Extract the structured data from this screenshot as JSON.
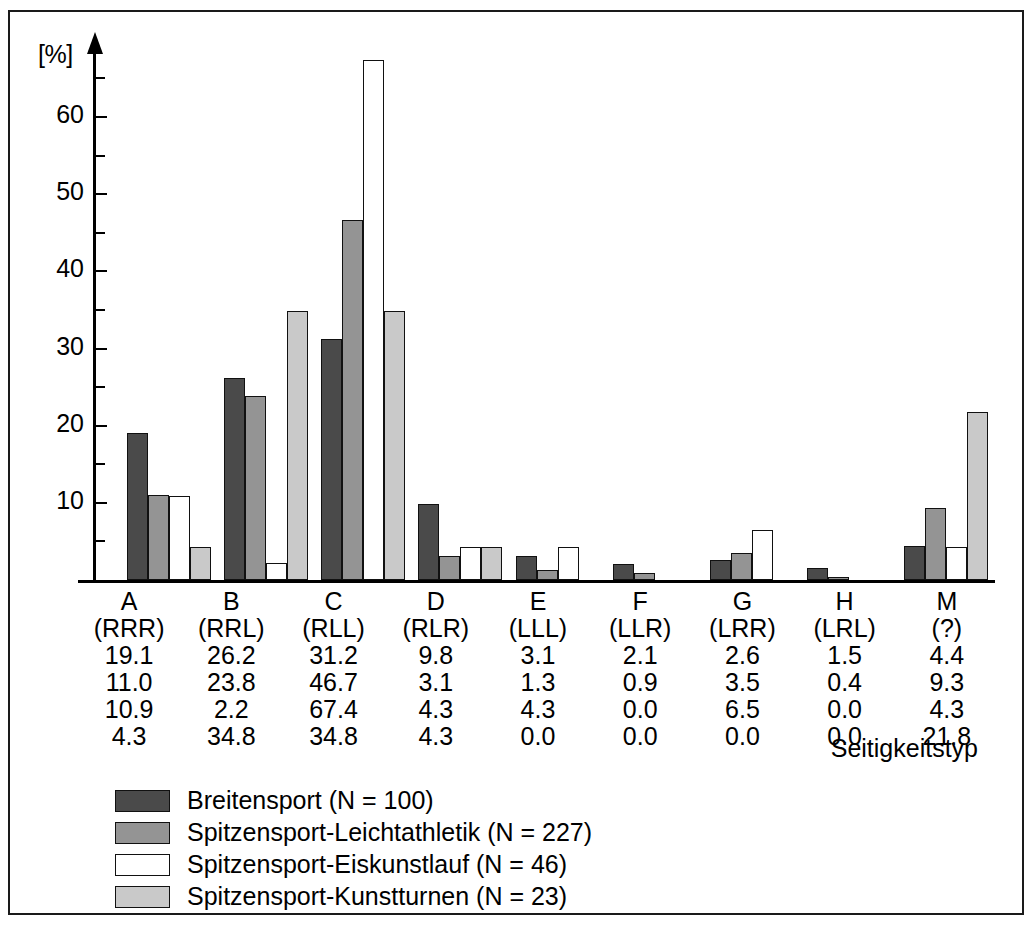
{
  "chart_data": {
    "type": "bar",
    "title": "",
    "xlabel": "Seitigkeitstyp",
    "ylabel": "[%]",
    "ylim": [
      0,
      68
    ],
    "grid": false,
    "legend_position": "bottom-left",
    "y_major_ticks": [
      10,
      20,
      30,
      40,
      50,
      60
    ],
    "y_minor_ticks": [
      5,
      15,
      25,
      35,
      45,
      55,
      65
    ],
    "categories": [
      "A",
      "B",
      "C",
      "D",
      "E",
      "F",
      "G",
      "H",
      "M"
    ],
    "category_codes": [
      "(RRR)",
      "(RRL)",
      "(RLL)",
      "(RLR)",
      "(LLL)",
      "(LLR)",
      "(LRR)",
      "(LRL)",
      "(?)"
    ],
    "series": [
      {
        "name": "Breitensport (N = 100)",
        "color": "#4a4a4a",
        "values": [
          19.1,
          26.2,
          31.2,
          9.8,
          3.1,
          2.1,
          2.6,
          1.5,
          4.4
        ]
      },
      {
        "name": "Spitzensport-Leichtathletik (N = 227)",
        "color": "#949494",
        "values": [
          11.0,
          23.8,
          46.7,
          3.1,
          1.3,
          0.9,
          3.5,
          0.4,
          9.3
        ]
      },
      {
        "name": "Spitzensport-Eiskunstlauf (N = 46)",
        "color": "#ffffff",
        "values": [
          10.9,
          2.2,
          67.4,
          4.3,
          4.3,
          0.0,
          6.5,
          0.0,
          4.3
        ]
      },
      {
        "name": "Spitzensport-Kunstturnen (N = 23)",
        "color": "#c9c9c9",
        "values": [
          4.3,
          34.8,
          34.8,
          4.3,
          0.0,
          0.0,
          0.0,
          0.0,
          21.8
        ]
      }
    ]
  },
  "axis": {
    "unit_label": "[%]",
    "x_title": "Seitigkeitstyp"
  },
  "table": {
    "header_row": [
      "A",
      "B",
      "C",
      "D",
      "E",
      "F",
      "G",
      "H",
      "M"
    ],
    "code_row": [
      "(RRR)",
      "(RRL)",
      "(RLL)",
      "(RLR)",
      "(LLL)",
      "(LLR)",
      "(LRR)",
      "(LRL)",
      "(?)"
    ],
    "rows": [
      [
        "19.1",
        "26.2",
        "31.2",
        "9.8",
        "3.1",
        "2.1",
        "2.6",
        "1.5",
        "4.4"
      ],
      [
        "11.0",
        "23.8",
        "46.7",
        "3.1",
        "1.3",
        "0.9",
        "3.5",
        "0.4",
        "9.3"
      ],
      [
        "10.9",
        "2.2",
        "67.4",
        "4.3",
        "4.3",
        "0.0",
        "6.5",
        "0.0",
        "4.3"
      ],
      [
        "4.3",
        "34.8",
        "34.8",
        "4.3",
        "0.0",
        "0.0",
        "0.0",
        "0.0",
        "21.8"
      ]
    ]
  },
  "legend": {
    "items": [
      {
        "label": "Breitensport (N = 100)",
        "swatch": "s0"
      },
      {
        "label": "Spitzensport-Leichtathletik (N = 227)",
        "swatch": "s1"
      },
      {
        "label": "Spitzensport-Eiskunstlauf (N = 46)",
        "swatch": "s2"
      },
      {
        "label": "Spitzensport-Kunstturnen (N = 23)",
        "swatch": "s3"
      }
    ]
  },
  "caption": ""
}
